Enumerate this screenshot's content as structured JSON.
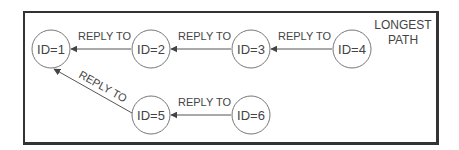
{
  "diagram": {
    "title_line1": "LONGEST",
    "title_line2": "PATH",
    "nodes": [
      {
        "id": "1",
        "label": "ID=1"
      },
      {
        "id": "2",
        "label": "ID=2"
      },
      {
        "id": "3",
        "label": "ID=3"
      },
      {
        "id": "4",
        "label": "ID=4"
      },
      {
        "id": "5",
        "label": "ID=5"
      },
      {
        "id": "6",
        "label": "ID=6"
      }
    ],
    "edges": [
      {
        "from": "2",
        "to": "1",
        "label": "REPLY TO"
      },
      {
        "from": "3",
        "to": "2",
        "label": "REPLY TO"
      },
      {
        "from": "4",
        "to": "3",
        "label": "REPLY TO"
      },
      {
        "from": "5",
        "to": "1",
        "label": "REPLY TO"
      },
      {
        "from": "6",
        "to": "5",
        "label": "REPLY TO"
      }
    ],
    "colors": {
      "stroke": "#555555",
      "frame": "#333333",
      "text": "#444444"
    }
  }
}
